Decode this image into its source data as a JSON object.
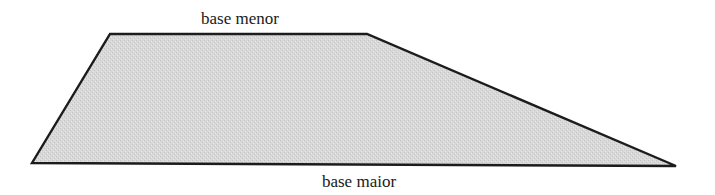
{
  "diagram": {
    "shape": "trapezoid",
    "labels": {
      "top_base": "base menor",
      "bottom_base": "base maior"
    },
    "vertices": {
      "top_left": [
        110,
        34
      ],
      "top_right": [
        367,
        34
      ],
      "bottom_right": [
        676,
        166
      ],
      "bottom_left": [
        32,
        163
      ]
    },
    "colors": {
      "fill": "#d6d6d6",
      "stroke": "#1c1c1c",
      "background": "#ffffff",
      "text": "#1a1a1a"
    }
  }
}
